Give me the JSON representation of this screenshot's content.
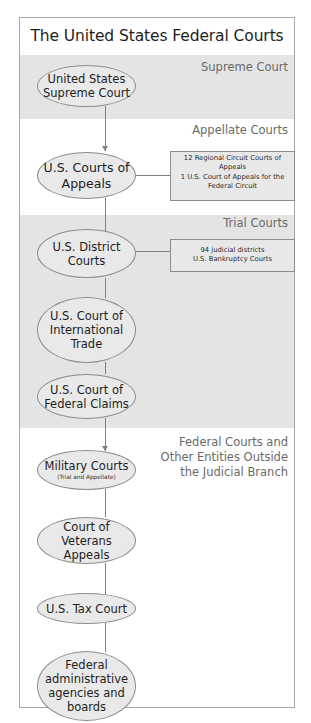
{
  "title": "The United States Federal Courts",
  "sections": {
    "supreme": {
      "label": "Supreme Court"
    },
    "appellate": {
      "label": "Appellate Courts"
    },
    "trial": {
      "label": "Trial Courts"
    },
    "other": {
      "label_lines": [
        "Federal Courts and",
        "Other Entities Outside",
        "the Judicial Branch"
      ]
    }
  },
  "nodes": {
    "supreme_court": {
      "lines": [
        "United States",
        "Supreme Court"
      ]
    },
    "courts_of_appeals": {
      "lines": [
        "U.S. Courts of",
        "Appeals"
      ]
    },
    "district_courts": {
      "lines": [
        "U.S. District",
        "Courts"
      ]
    },
    "international_trade": {
      "lines": [
        "U.S. Court of",
        "International",
        "Trade"
      ]
    },
    "federal_claims": {
      "lines": [
        "U.S. Court of",
        "Federal Claims"
      ]
    },
    "military_courts": {
      "lines": [
        "Military Courts"
      ],
      "sub": "(Trial and Appellate)"
    },
    "veterans_appeals": {
      "lines": [
        "Court of Veterans",
        "Appeals"
      ]
    },
    "tax_court": {
      "lines": [
        "U.S. Tax Court"
      ]
    },
    "admin_agencies": {
      "lines": [
        "Federal",
        "administrative",
        "agencies and",
        "boards"
      ]
    }
  },
  "notes": {
    "appeals_detail": {
      "lines": [
        "12 Regional Circuit Courts of",
        "Appeals",
        "1 U.S. Court of Appeals for the",
        "Federal Circuit"
      ]
    },
    "district_detail": {
      "lines": [
        "94 judicial districts",
        "U.S. Bankruptcy Courts"
      ]
    }
  },
  "colors": {
    "band_gray": "#e4e4e4",
    "node_fill": "#e9e9e9",
    "line": "#808080",
    "label_text": "#6a6a6a"
  }
}
